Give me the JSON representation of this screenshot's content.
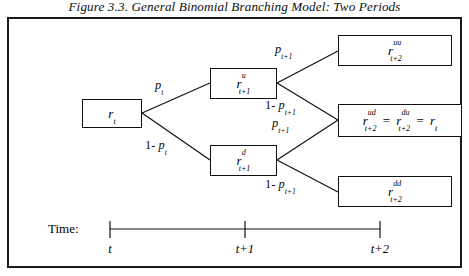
{
  "figure": {
    "title": "Figure 3.3. General Binomial Branching Model: Two Periods"
  },
  "nodes": {
    "root": {
      "label": "r t",
      "base": "r",
      "sup": "",
      "sub": "t"
    },
    "up": {
      "label": "r u t+1",
      "base": "r",
      "sup": "u",
      "sub": "t+1"
    },
    "down": {
      "label": "r d t+1",
      "base": "r",
      "sup": "d",
      "sub": "t+1"
    },
    "upup": {
      "label": "r uu t+2",
      "base": "r",
      "sup": "uu",
      "sub": "t+2"
    },
    "updown": {
      "label": "r ud t+2 = r du t+2 = r t",
      "base": "r",
      "sup": "ud",
      "sub": "t+2",
      "base2": "r",
      "sup2": "du",
      "sub2": "t+2",
      "base3": "r",
      "sub3": "t",
      "eq": "="
    },
    "downdown": {
      "label": "r dd t+2",
      "base": "r",
      "sup": "dd",
      "sub": "t+2"
    }
  },
  "probabilities": {
    "p_t": "p",
    "p_t_sub": "t",
    "one_minus": "1-",
    "p_t1": "p",
    "p_t1_sub": "t+1",
    "branch_up_1": "p t",
    "branch_down_1": "1- p t",
    "branch_up_2": "p t+1",
    "branch_upd_2": "1- p t+1",
    "branch_du_2": "p t+1",
    "branch_dd_2": "1- p t+1"
  },
  "timeline": {
    "label": "Time:",
    "ticks": [
      {
        "text": "t"
      },
      {
        "text": "t+1"
      },
      {
        "text": "t+2"
      }
    ]
  },
  "colors": {
    "ink": "#111111",
    "frame": "#1a1a1a",
    "background": "#ffffff"
  }
}
